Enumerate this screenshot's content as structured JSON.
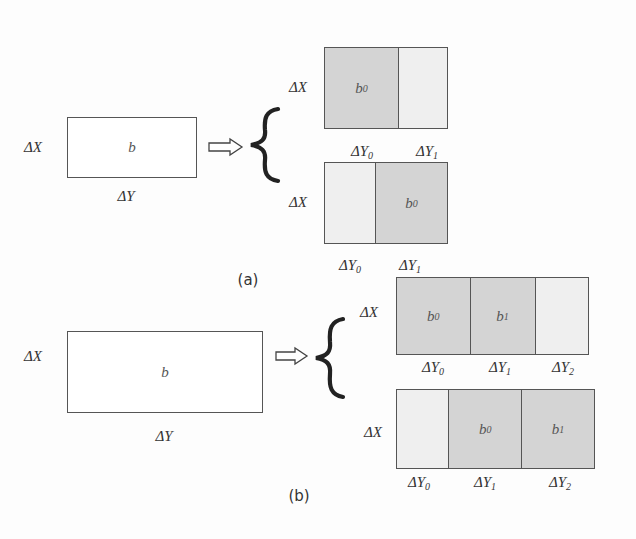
{
  "figure": {
    "colors": {
      "border": "#555555",
      "current_block": "#d4d4d4",
      "neighbor_block": "#efefef",
      "source_block": "#ffffff"
    },
    "panel_a": {
      "caption": "(a)",
      "source": {
        "height_label": "ΔX",
        "width_label": "ΔY",
        "block_label": "b"
      },
      "arrow_icon": "double-outline-right-arrow",
      "brace_icon": "left-curly-brace",
      "splits": [
        {
          "height_label": "ΔX",
          "cells": [
            {
              "block": "b",
              "sub": "0",
              "shade": "dark",
              "width_label": "ΔY",
              "width_sub": "0"
            },
            {
              "block": "",
              "sub": "",
              "shade": "light",
              "width_label": "ΔY",
              "width_sub": "1"
            }
          ]
        },
        {
          "height_label": "ΔX",
          "cells": [
            {
              "block": "",
              "sub": "",
              "shade": "light",
              "width_label": "ΔY",
              "width_sub": "0"
            },
            {
              "block": "b",
              "sub": "0",
              "shade": "dark",
              "width_label": "ΔY",
              "width_sub": "1"
            }
          ]
        }
      ]
    },
    "panel_b": {
      "caption": "(b)",
      "source": {
        "height_label": "ΔX",
        "width_label": "ΔY",
        "block_label": "b"
      },
      "arrow_icon": "double-outline-right-arrow",
      "brace_icon": "left-curly-brace",
      "splits": [
        {
          "height_label": "ΔX",
          "cells": [
            {
              "block": "b",
              "sub": "0",
              "shade": "dark",
              "width_label": "ΔY",
              "width_sub": "0"
            },
            {
              "block": "b",
              "sub": "1",
              "shade": "dark",
              "width_label": "ΔY",
              "width_sub": "1"
            },
            {
              "block": "",
              "sub": "",
              "shade": "light",
              "width_label": "ΔY",
              "width_sub": "2"
            }
          ]
        },
        {
          "height_label": "ΔX",
          "cells": [
            {
              "block": "",
              "sub": "",
              "shade": "light",
              "width_label": "ΔY",
              "width_sub": "0"
            },
            {
              "block": "b",
              "sub": "0",
              "shade": "dark",
              "width_label": "ΔY",
              "width_sub": "1"
            },
            {
              "block": "b",
              "sub": "1",
              "shade": "dark",
              "width_label": "ΔY",
              "width_sub": "2"
            }
          ]
        }
      ]
    }
  }
}
